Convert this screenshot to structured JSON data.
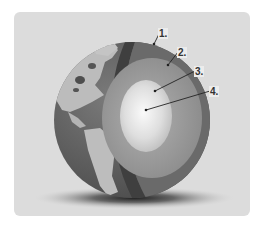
{
  "diagram": {
    "labels": [
      {
        "id": "1",
        "text": "1.",
        "target": "crust",
        "x": 160,
        "y": 28
      },
      {
        "id": "2",
        "text": "2.",
        "target": "mantle",
        "x": 179,
        "y": 47
      },
      {
        "id": "3",
        "text": "3.",
        "target": "outer-core",
        "x": 196,
        "y": 66
      },
      {
        "id": "4",
        "text": "4.",
        "target": "inner-core",
        "x": 211,
        "y": 86
      }
    ],
    "colors": {
      "panel": "#dcdcdc",
      "crust": "#4a4a4a",
      "mantle": "#6e6e6e",
      "outer_core": "#9a9a9a",
      "inner_core": "#e8e8e8",
      "ocean": "#5c5c5c",
      "land": "#b9b9b9"
    }
  }
}
